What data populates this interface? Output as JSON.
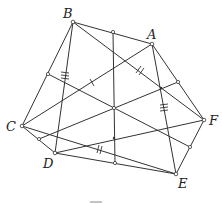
{
  "diagram": {
    "type": "geometry",
    "points": {
      "B": {
        "label": "B",
        "x": 73,
        "y": 22,
        "lx": 62,
        "ly": 18
      },
      "A": {
        "label": "A",
        "x": 152,
        "y": 44,
        "lx": 147,
        "ly": 39
      },
      "C": {
        "label": "C",
        "x": 22,
        "y": 126,
        "lx": 6,
        "ly": 131
      },
      "F": {
        "label": "F",
        "x": 204,
        "y": 120,
        "lx": 209,
        "ly": 125
      },
      "D": {
        "label": "D",
        "x": 55,
        "y": 153,
        "lx": 43,
        "ly": 169
      },
      "E": {
        "label": "E",
        "x": 176,
        "y": 174,
        "lx": 178,
        "ly": 189
      }
    },
    "labels": [
      "A",
      "B",
      "C",
      "D",
      "E",
      "F"
    ],
    "midpoints": [
      "BA",
      "BC",
      "AF",
      "CD",
      "FE",
      "DE"
    ],
    "center": {
      "x": 114,
      "y": 108
    },
    "tick_marks": [
      {
        "segment": "BD",
        "count": 3
      },
      {
        "segment": "AE",
        "count": 3
      },
      {
        "segment": "BF",
        "count": 2
      },
      {
        "segment": "CE",
        "count": 2
      },
      {
        "segment": "AC",
        "count": 1
      }
    ],
    "stroke_color": "#333333",
    "background": "#ffffff"
  }
}
